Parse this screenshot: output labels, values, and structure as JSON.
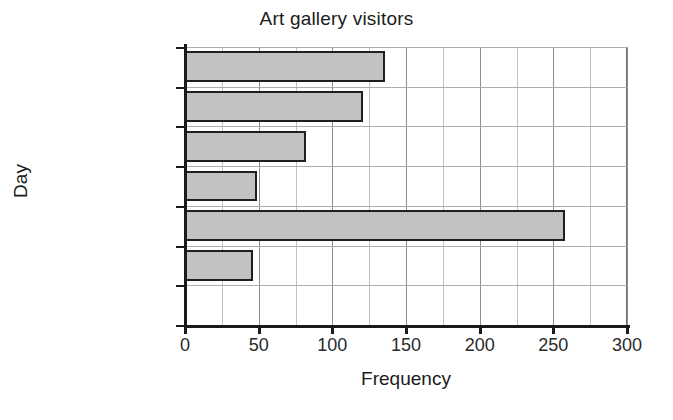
{
  "chart_data": {
    "type": "bar",
    "orientation": "horizontal",
    "title": "Art gallery visitors",
    "xlabel": "Frequency",
    "ylabel": "Day",
    "categories": [
      "Monday",
      "Tuesday",
      "Wednesday",
      "Thursday",
      "Friday",
      "Saturday",
      "Sunday"
    ],
    "values": [
      0,
      46,
      258,
      49,
      82,
      121,
      136
    ],
    "xlim": [
      0,
      300
    ],
    "xticks": [
      0,
      50,
      100,
      150,
      200,
      250,
      300
    ],
    "xtick_labels": [
      "0",
      "50",
      "100",
      "150",
      "200",
      "250",
      "300"
    ],
    "minor_tick_step": 25,
    "grid": true,
    "legend": "none",
    "bar_fill_color": "#c2c2c2",
    "bar_edge_color": "#1f1f1f",
    "grid_color": "#adadad",
    "axis_color": "#1a1a1a",
    "background_color": "#ffffff"
  },
  "axis": {
    "y_categories_top_to_bottom": [
      "Sunday",
      "Saturday",
      "Friday",
      "Thursday",
      "Wednesday",
      "Tuesday",
      "Monday"
    ]
  }
}
